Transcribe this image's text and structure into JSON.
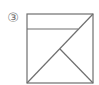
{
  "figure": {
    "label": "③",
    "stroke_color": "#6f6f6f",
    "shape": "square",
    "square": {
      "x1": 27,
      "y1": 14,
      "x2": 93,
      "y2": 83
    },
    "lines": [
      {
        "name": "horizontal-line",
        "x1": 27,
        "y1": 29,
        "x2": 78,
        "y2": 29
      },
      {
        "name": "diagonal-line",
        "x1": 27,
        "y1": 83,
        "x2": 93,
        "y2": 14
      },
      {
        "name": "midpoint-to-corner-line",
        "x1": 60,
        "y1": 49,
        "x2": 93,
        "y2": 83
      }
    ]
  }
}
